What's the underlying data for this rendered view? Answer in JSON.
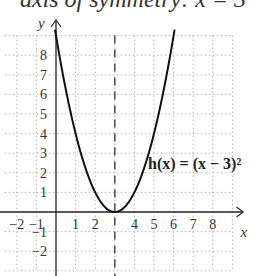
{
  "header": {
    "text_fragment": "axis of symmetry: x = 3"
  },
  "chart_data": {
    "type": "line",
    "title": "",
    "function_label": "h(x) = (x − 3)²",
    "xlabel": "x",
    "ylabel": "y",
    "xlim": [
      -2,
      9
    ],
    "ylim": [
      -3,
      9
    ],
    "x_ticks": [
      "−2",
      "−1",
      "1",
      "2",
      "4",
      "5",
      "6",
      "7",
      "8"
    ],
    "y_ticks": [
      "8",
      "7",
      "6",
      "5",
      "4",
      "3",
      "2",
      "1",
      "−1",
      "−2"
    ],
    "grid": true,
    "axis_of_symmetry": {
      "x": 3,
      "style": "dashed"
    },
    "vertex": [
      3,
      0
    ],
    "series": [
      {
        "name": "h(x) = (x − 3)²",
        "x": [
          0,
          0.5,
          1,
          1.5,
          2,
          2.5,
          3,
          3.5,
          4,
          4.5,
          5,
          5.5,
          6
        ],
        "values": [
          9,
          6.25,
          4,
          2.25,
          1,
          0.25,
          0,
          0.25,
          1,
          2.25,
          4,
          6.25,
          9
        ]
      }
    ]
  }
}
